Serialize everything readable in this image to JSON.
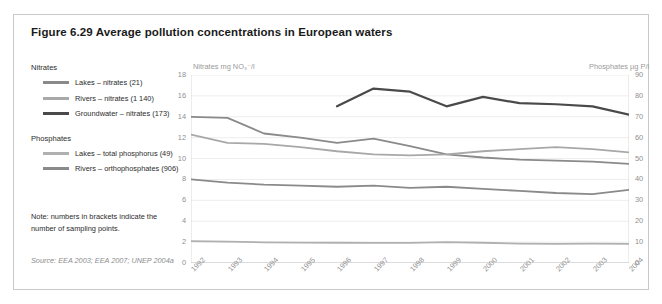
{
  "figure": {
    "title": "Figure 6.29 Average pollution concentrations in European waters",
    "note": "Note: numbers in brackets indicate the number of sampling points.",
    "source": "Source: EEA 2003; EEA 2007; UNEP 2004a"
  },
  "legend": {
    "group_nitrates_label": "Nitrates",
    "group_phosphates_label": "Phosphates",
    "items": [
      {
        "label": "Lakes – nitrates (21)",
        "color": "#8a8a8a"
      },
      {
        "label": "Rivers – nitrates (1 140)",
        "color": "#a8a8a8"
      },
      {
        "label": "Groundwater – nitrates (173)",
        "color": "#4a4a4a"
      },
      {
        "label": "Lakes – total phosphorus (49)",
        "color": "#b0b0b0"
      },
      {
        "label": "Rivers – orthophosphates (906)",
        "color": "#8a8a8a"
      }
    ]
  },
  "chart_data": {
    "type": "line",
    "title": "Average pollution concentrations in European waters",
    "xlabel": "",
    "ylabel": "Nitrates mg NO3-/l",
    "y2label": "Phosphates µg P/l",
    "ylim": [
      0,
      18
    ],
    "y2lim": [
      0,
      90
    ],
    "grid": true,
    "legend_position": "left",
    "categories": [
      "1992",
      "1993",
      "1994",
      "1995",
      "1996",
      "1997",
      "1998",
      "1999",
      "2000",
      "2001",
      "2002",
      "2003",
      "2004"
    ],
    "yticks": [
      0,
      2,
      4,
      6,
      8,
      10,
      12,
      14,
      16,
      18
    ],
    "y2ticks": [
      0,
      10,
      20,
      30,
      40,
      50,
      60,
      70,
      80,
      90
    ],
    "series": [
      {
        "name": "Lakes – nitrates (21)",
        "axis": "left",
        "unit": "mg NO3-/l",
        "color": "#8a8a8a",
        "values": [
          14.0,
          13.9,
          12.4,
          12.0,
          11.5,
          11.9,
          11.2,
          10.4,
          10.1,
          9.9,
          9.8,
          9.7,
          9.5
        ]
      },
      {
        "name": "Rivers – nitrates (1 140)",
        "axis": "left",
        "unit": "mg NO3-/l",
        "color": "#a8a8a8",
        "values": [
          12.3,
          11.5,
          11.4,
          11.1,
          10.7,
          10.4,
          10.3,
          10.4,
          10.7,
          10.9,
          11.1,
          10.9,
          10.6
        ]
      },
      {
        "name": "Groundwater – nitrates (173)",
        "axis": "left",
        "unit": "mg NO3-/l",
        "color": "#4a4a4a",
        "values": [
          null,
          null,
          null,
          null,
          15.0,
          16.7,
          16.4,
          15.0,
          15.9,
          15.3,
          15.2,
          15.0,
          14.2
        ]
      },
      {
        "name": "Lakes – total phosphorus (49)",
        "axis": "right",
        "unit": "µg P/l",
        "color": "#b0b0b0",
        "values": [
          10.5,
          10.2,
          9.9,
          9.8,
          9.7,
          9.6,
          9.6,
          10.0,
          9.7,
          9.3,
          9.2,
          9.3,
          9.2
        ]
      },
      {
        "name": "Rivers – orthophosphates (906)",
        "axis": "right",
        "unit": "µg P/l",
        "color": "#8a8a8a",
        "values": [
          40.0,
          38.5,
          37.5,
          37.0,
          36.5,
          37.0,
          36.0,
          36.5,
          35.5,
          34.5,
          33.5,
          33.0,
          35.0
        ]
      }
    ]
  }
}
